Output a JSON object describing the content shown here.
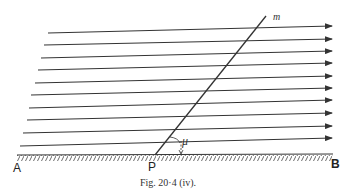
{
  "figure": {
    "caption": "Fig. 20·4 (iv).",
    "labels": {
      "A": "A",
      "B": "B",
      "P": "P",
      "m": "m",
      "mu": "μ"
    },
    "stream_lines": [
      {
        "y_left": 33,
        "y_right": 26,
        "x_left": 48
      },
      {
        "y_left": 45,
        "y_right": 39,
        "x_left": 44
      },
      {
        "y_left": 58,
        "y_right": 51,
        "x_left": 41
      },
      {
        "y_left": 70,
        "y_right": 63,
        "x_left": 38
      },
      {
        "y_left": 83,
        "y_right": 76,
        "x_left": 35
      },
      {
        "y_left": 95,
        "y_right": 88,
        "x_left": 31
      },
      {
        "y_left": 108,
        "y_right": 100,
        "x_left": 29
      },
      {
        "y_left": 120,
        "y_right": 113,
        "x_left": 27
      },
      {
        "y_left": 133,
        "y_right": 126,
        "x_left": 23
      },
      {
        "y_left": 146,
        "y_right": 138,
        "x_left": 20
      }
    ],
    "colors": {
      "ink": "#333333",
      "background": "#ffffff"
    }
  }
}
